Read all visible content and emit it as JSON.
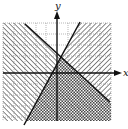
{
  "figure": {
    "type": "system-of-linear-inequalities-graph",
    "axes": {
      "x_label": "x",
      "y_label": "y"
    },
    "grid": {
      "columns": 10,
      "rows": 9,
      "style": "dotted"
    },
    "lines": [
      {
        "id": "line-decreasing",
        "slope_direction": "negative",
        "style": "solid"
      },
      {
        "id": "line-increasing",
        "slope_direction": "positive",
        "style": "solid"
      }
    ],
    "regions": [
      {
        "id": "left-region",
        "shading": "hatch-forward-slash"
      },
      {
        "id": "right-region",
        "shading": "hatch-back-slash"
      },
      {
        "id": "bottom-region",
        "shading": "crosshatch-solution"
      },
      {
        "id": "top-region",
        "shading": "none"
      }
    ],
    "colors": {
      "background": "#ffffff",
      "line": "#111111",
      "grid": "#888888",
      "hatch": "#555555"
    }
  }
}
